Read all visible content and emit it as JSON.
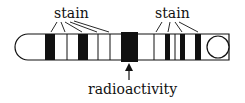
{
  "diagram": {
    "labels": {
      "stain_left": "stain",
      "stain_right": "stain",
      "radioactivity": "radioactivity"
    },
    "colors": {
      "outline": "#111111",
      "band": "#111111",
      "background": "#ffffff"
    }
  }
}
